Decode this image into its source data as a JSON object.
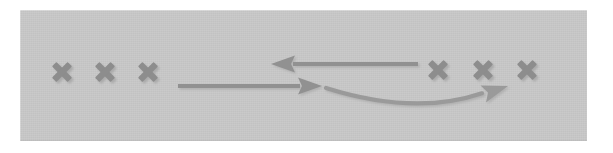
{
  "figure": {
    "title": "",
    "background_color": "#ffffff",
    "panel_color": "#c8c8c8",
    "panel": {
      "x": 20,
      "y": 10,
      "width": 567,
      "height": 131
    },
    "stroke_color": "#8f8f8f",
    "shadow_color": "#b0b0b0"
  },
  "marks": {
    "icon": "x-mark-icon",
    "glyph": "✕",
    "color": "#8d8d8d",
    "left_group": {
      "label": "",
      "count": 3,
      "items": [
        {
          "name": "x-mark-left-1",
          "cx": 62,
          "cy": 72,
          "size": 26
        },
        {
          "name": "x-mark-left-2",
          "cx": 105,
          "cy": 72,
          "size": 26
        },
        {
          "name": "x-mark-left-3",
          "cx": 148,
          "cy": 72,
          "size": 26
        }
      ]
    },
    "right_group": {
      "label": "",
      "count": 3,
      "items": [
        {
          "name": "x-mark-right-1",
          "cx": 438,
          "cy": 70,
          "size": 26
        },
        {
          "name": "x-mark-right-2",
          "cx": 483,
          "cy": 70,
          "size": 26
        },
        {
          "name": "x-mark-right-3",
          "cx": 527,
          "cy": 70,
          "size": 26
        }
      ]
    }
  },
  "arrows": [
    {
      "name": "arrow-leftward",
      "icon": "arrow-left-icon",
      "label": "",
      "direction": "left",
      "shape": "straight",
      "color": "#919191",
      "tail": {
        "x": 418,
        "y": 64
      },
      "tip": {
        "x": 271,
        "y": 64
      },
      "shaft_thickness": 4,
      "head_length": 24,
      "head_width": 17
    },
    {
      "name": "arrow-rightward",
      "icon": "arrow-right-icon",
      "label": "",
      "direction": "right",
      "shape": "straight",
      "color": "#919191",
      "tail": {
        "x": 178,
        "y": 86
      },
      "tip": {
        "x": 322,
        "y": 86
      },
      "shaft_thickness": 4,
      "head_length": 24,
      "head_width": 17
    },
    {
      "name": "arrow-curved-right",
      "icon": "arrow-curved-right-icon",
      "label": "",
      "direction": "right",
      "shape": "curved",
      "color": "#9a9a9a",
      "tail": {
        "x": 326,
        "y": 88
      },
      "control": {
        "x": 415,
        "y": 116
      },
      "tip": {
        "x": 508,
        "y": 86
      },
      "shaft_thickness": 4,
      "head_length": 26,
      "head_width": 18
    }
  ],
  "legend": {
    "visible": false,
    "entries": []
  },
  "annotations": []
}
